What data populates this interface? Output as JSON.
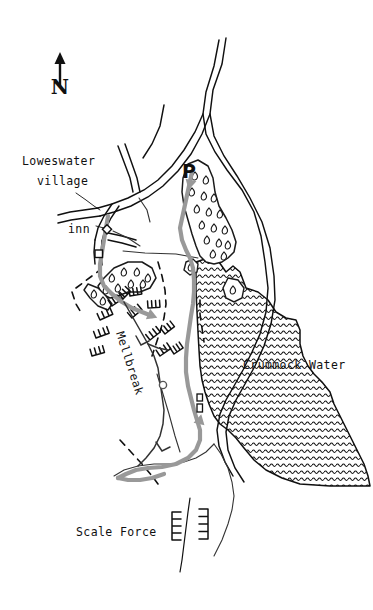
{
  "map": {
    "title": "Loweswater and Mellbreak walking route map",
    "type": "hand-drawn sketch map",
    "width": 373,
    "height": 610,
    "background_color": "#ffffff",
    "ink_color": "#101010",
    "route_color": "#999999",
    "water_color": "#101010"
  },
  "compass": {
    "letter": "N",
    "icon": "north-arrow-icon",
    "x": 60,
    "y": 60
  },
  "labels": [
    {
      "id": "loweswater-village",
      "text_line_1": "Loweswater",
      "text_line_2": "village",
      "x": 22,
      "y": 160,
      "rotation": 0,
      "leader_line": true
    },
    {
      "id": "inn",
      "text": "inn",
      "x": 68,
      "y": 229,
      "rotation": 0,
      "leader_line": true
    },
    {
      "id": "parking",
      "text": "P",
      "x": 186,
      "y": 165,
      "rotation": 0,
      "style": "bold-large",
      "meaning": "car park"
    },
    {
      "id": "mellbreak",
      "text": "Mellbreak",
      "x": 116,
      "y": 333,
      "rotation": 72,
      "meaning": "fell summit ridge"
    },
    {
      "id": "crummock-water",
      "text": "Crummock Water",
      "x": 243,
      "y": 364,
      "rotation": 0,
      "meaning": "lake"
    },
    {
      "id": "scale-force",
      "text": "Scale Force",
      "x": 76,
      "y": 531,
      "rotation": 0,
      "meaning": "waterfall"
    }
  ],
  "features": {
    "lake": {
      "name": "Crummock Water",
      "fill_pattern": "horizontal-wavy-hatch",
      "color": "#101010"
    },
    "woodland": {
      "name": "woodland",
      "symbol": "teardrop-trees",
      "outline_color": "#1a1a1a"
    },
    "route": {
      "name": "walking route",
      "color": "#999999",
      "width": 4,
      "style": "solid with direction arrows"
    },
    "roads": {
      "name": "roads",
      "style": "double-line casing",
      "color": "#101010"
    },
    "footpaths": {
      "name": "footpaths",
      "style": "thin solid line",
      "color": "#333333"
    },
    "boundary": {
      "name": "dashed boundary / wall",
      "style": "dashed",
      "color": "#101010"
    },
    "crags": {
      "name": "crags",
      "symbol": "comb-tick-marks",
      "color": "#101010"
    },
    "buildings": {
      "name": "buildings",
      "symbol": "small-square",
      "color": "#101010"
    },
    "waypoint": {
      "name": "waypoint",
      "symbol": "small-circle",
      "color": "#555555"
    }
  }
}
